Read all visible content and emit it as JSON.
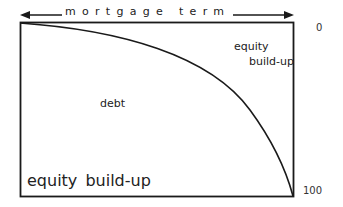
{
  "diagram": {
    "top_axis": {
      "label": "mortgage term",
      "arrows": "double-headed"
    },
    "right_axis": {
      "top_value": "0",
      "bottom_value": "100"
    },
    "regions": {
      "upper_right": {
        "line1": "equity",
        "line2": "build-up"
      },
      "middle": "debt",
      "bottom_left": "equity build-up"
    },
    "colors": {
      "line": "#1a1a1a",
      "background": "#ffffff"
    }
  }
}
